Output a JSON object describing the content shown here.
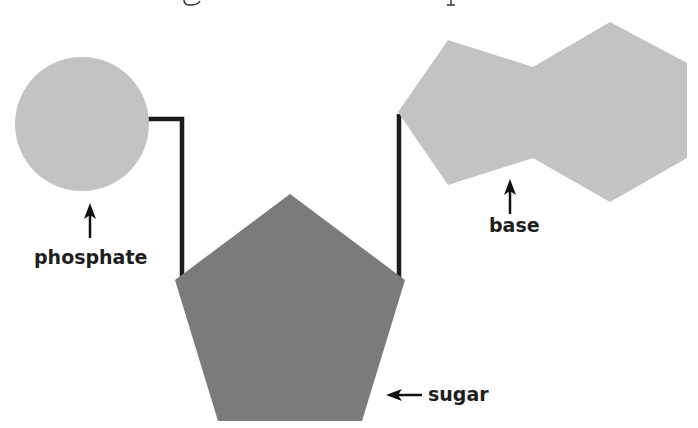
{
  "diagram": {
    "title_fragment_visible": true,
    "colors": {
      "phosphate": "#c3c3c3",
      "base": "#c3c3c3",
      "sugar": "#7b7b7b",
      "bond": "#1c1c1c",
      "text": "#1e1e1e"
    },
    "components": [
      {
        "id": "phosphate",
        "label": "phosphate",
        "shape": "circle"
      },
      {
        "id": "sugar",
        "label": "sugar",
        "shape": "pentagon"
      },
      {
        "id": "base",
        "label": "base",
        "shape": "fused pentagon-hexagon"
      }
    ],
    "labels": {
      "phosphate": "phosphate",
      "sugar": "sugar",
      "base": "base"
    }
  }
}
